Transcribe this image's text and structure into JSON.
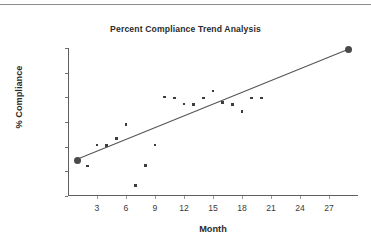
{
  "figure": {
    "top_rule_color": "#8c8c8c",
    "background": "#ffffff",
    "text_color": "#2b2b2b",
    "marker_color": "#3d3d3d",
    "line_color": "#555555"
  },
  "chart_data": {
    "type": "scatter",
    "title": "Percent Compliance Trend Analysis",
    "xlabel": "Month",
    "ylabel": "% Compliance",
    "xlim": [
      0,
      30
    ],
    "ylim": [
      30,
      90
    ],
    "xticks": [
      3,
      6,
      9,
      12,
      15,
      18,
      21,
      24,
      27
    ],
    "yticks": [
      30,
      40,
      50,
      60,
      70,
      80,
      90
    ],
    "grid": false,
    "legend": null,
    "series": [
      {
        "name": "Monthly compliance",
        "marker": "square-small",
        "points": [
          {
            "x": 1,
            "y": 44.5,
            "size": "large"
          },
          {
            "x": 2,
            "y": 42.2,
            "size": "small"
          },
          {
            "x": 3,
            "y": 50.6,
            "size": "small"
          },
          {
            "x": 4,
            "y": 50.5,
            "size": "small"
          },
          {
            "x": 5,
            "y": 53.4,
            "size": "small"
          },
          {
            "x": 6,
            "y": 59.0,
            "size": "small"
          },
          {
            "x": 7,
            "y": 34.2,
            "size": "small"
          },
          {
            "x": 8,
            "y": 42.4,
            "size": "small"
          },
          {
            "x": 9,
            "y": 50.6,
            "size": "small"
          },
          {
            "x": 10,
            "y": 70.1,
            "size": "small"
          },
          {
            "x": 11,
            "y": 69.7,
            "size": "small"
          },
          {
            "x": 12,
            "y": 67.3,
            "size": "small"
          },
          {
            "x": 13,
            "y": 67.2,
            "size": "small"
          },
          {
            "x": 14,
            "y": 69.8,
            "size": "small"
          },
          {
            "x": 15,
            "y": 72.6,
            "size": "small"
          },
          {
            "x": 16,
            "y": 67.9,
            "size": "small"
          },
          {
            "x": 17,
            "y": 67.2,
            "size": "small"
          },
          {
            "x": 18,
            "y": 64.3,
            "size": "small"
          },
          {
            "x": 19,
            "y": 69.8,
            "size": "small"
          },
          {
            "x": 20,
            "y": 69.8,
            "size": "small"
          },
          {
            "x": 29,
            "y": 89.5,
            "size": "large"
          }
        ]
      }
    ],
    "trendline": {
      "name": "Linear trend",
      "x0": 1,
      "y0": 45.0,
      "x1": 29,
      "y1": 89.5
    }
  }
}
